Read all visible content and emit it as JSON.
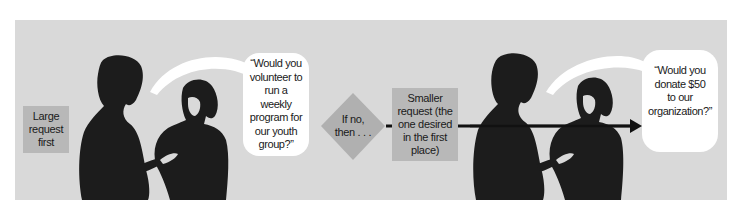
{
  "diagram": {
    "steps": [
      {
        "id": "large-request",
        "label": "Large request first"
      },
      {
        "id": "speech-1",
        "label": "“Would you volunteer to run a weekly program for our youth group?”"
      },
      {
        "id": "condition",
        "label": "If no, then . . ."
      },
      {
        "id": "smaller-request",
        "label": "Smaller request (the one desired in the first place)"
      },
      {
        "id": "speech-2",
        "label": "“Would you donate $50 to our organization?”"
      }
    ],
    "large_request": {
      "lines": [
        "Large",
        "request",
        "first"
      ]
    },
    "speech_bubble_1": {
      "lines": [
        "“Would you",
        "volunteer to",
        "run a",
        "weekly",
        "program for",
        "our youth",
        "group?”"
      ]
    },
    "condition": {
      "lines": [
        "If no,",
        "then . . ."
      ]
    },
    "smaller_request": {
      "lines": [
        "Smaller",
        "request (the",
        "one desired",
        "in the first",
        "place)"
      ]
    },
    "speech_bubble_2": {
      "lines": [
        "“Would you",
        "donate $50",
        "to our",
        "organization?”"
      ]
    },
    "colors": {
      "panel": "#d9d9d9",
      "box": "#b8b8b8",
      "diamond": "#b0b0b0",
      "silhouette": "#1c1c1c",
      "bubble": "#ffffff",
      "arrow": "#111111"
    }
  }
}
